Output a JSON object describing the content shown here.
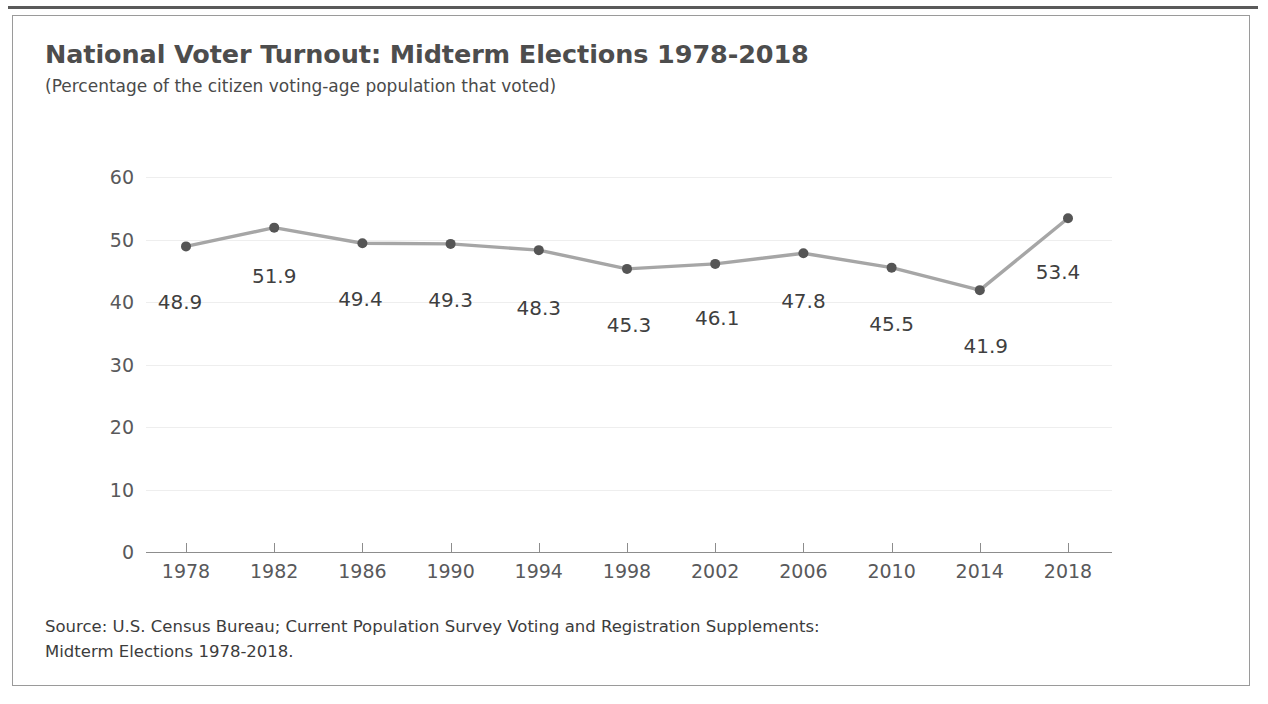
{
  "figure": {
    "title": "National Voter Turnout: Midterm Elections 1978-2018",
    "subtitle": "(Percentage of the citizen voting-age population that voted)",
    "source_line1": "Source: U.S. Census Bureau; Current Population Survey Voting and Registration Supplements:",
    "source_line2": "Midterm Elections 1978-2018.",
    "colors": {
      "title": "#4d4d4d",
      "line": "#a6a6a6",
      "marker": "#555555",
      "grid": "#eeeeee",
      "axis": "#8d8d8d",
      "border": "#9a9a9a",
      "top_rule": "#5a5a5a"
    }
  },
  "chart_data": {
    "type": "line",
    "title": "National Voter Turnout: Midterm Elections 1978-2018",
    "subtitle": "(Percentage of the citizen voting-age population that voted)",
    "xlabel": "",
    "ylabel": "",
    "categories": [
      "1978",
      "1982",
      "1986",
      "1990",
      "1994",
      "1998",
      "2002",
      "2006",
      "2010",
      "2014",
      "2018"
    ],
    "values": [
      48.9,
      51.9,
      49.4,
      49.3,
      48.3,
      45.3,
      46.1,
      47.8,
      45.5,
      41.9,
      53.4
    ],
    "data_labels": [
      "48.9",
      "51.9",
      "49.4",
      "49.3",
      "48.3",
      "45.3",
      "46.1",
      "47.8",
      "45.5",
      "41.9",
      "53.4"
    ],
    "ylim": [
      0,
      60
    ],
    "yticks": [
      0,
      10,
      20,
      30,
      40,
      50,
      60
    ],
    "ytick_labels": [
      "0",
      "10",
      "20",
      "30",
      "40",
      "50",
      "60"
    ],
    "grid": "horizontal",
    "legend": "none",
    "marker": "circle",
    "series": [
      {
        "name": "National voter turnout",
        "values": [
          48.9,
          51.9,
          49.4,
          49.3,
          48.3,
          45.3,
          46.1,
          47.8,
          45.5,
          41.9,
          53.4
        ]
      }
    ]
  }
}
